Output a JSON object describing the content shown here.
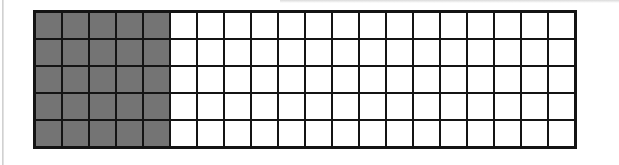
{
  "grid": {
    "rows": 5,
    "columns": 20,
    "total_cells": 100,
    "shaded_columns": 5,
    "shaded_cells": 25,
    "shaded_fraction": "25/100",
    "colors": {
      "shaded": "#747474",
      "unshaded": "#ffffff",
      "line": "#141414",
      "background": "#ffffff",
      "page_edge": "#c9c9c9"
    }
  }
}
